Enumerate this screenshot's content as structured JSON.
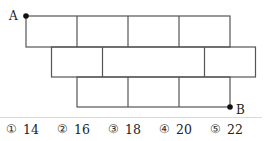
{
  "diagram": {
    "rows": [
      {
        "cells": 4
      },
      {
        "cells": 3,
        "cell_units": [
          1,
          2,
          1
        ]
      },
      {
        "cells": 3
      }
    ],
    "point_a": {
      "label": "A"
    },
    "point_b": {
      "label": "B"
    }
  },
  "choices": [
    {
      "marker": "①",
      "value": "14"
    },
    {
      "marker": "②",
      "value": "16"
    },
    {
      "marker": "③",
      "value": "18"
    },
    {
      "marker": "④",
      "value": "20"
    },
    {
      "marker": "⑤",
      "value": "22"
    }
  ]
}
